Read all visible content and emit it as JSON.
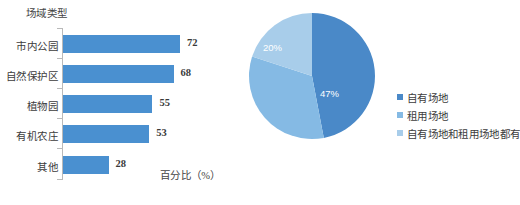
{
  "chart_data": [
    {
      "type": "bar",
      "orientation": "horizontal",
      "title": "",
      "xlabel": "百分比（%）",
      "ylabel": "场域类型",
      "categories": [
        "市内公园",
        "自然保护区",
        "植物园",
        "有机农庄",
        "其他"
      ],
      "values": [
        72,
        68,
        55,
        53,
        28
      ],
      "value_suffix": "",
      "xlim": [
        0,
        80
      ],
      "grid": false,
      "legend": "none",
      "series_color": "#4a90d0"
    },
    {
      "type": "pie",
      "title": "",
      "labels": [
        "自有场地",
        "租用场地",
        "自有场地和租用场地都有"
      ],
      "values": [
        47,
        33,
        20
      ],
      "value_labels": [
        "47%",
        "33%",
        "20%"
      ],
      "colors": [
        "#4a89c8",
        "#85bae4",
        "#a8cdea"
      ],
      "start_angle_deg": 0,
      "direction": "clockwise",
      "legend": "right"
    }
  ],
  "bar_chart": {
    "axis_title_y": "场域类型",
    "axis_title_x": "百分比（%）",
    "rows": [
      {
        "label": "市内公园",
        "value": "72"
      },
      {
        "label": "自然保护区",
        "value": "68"
      },
      {
        "label": "植物园",
        "value": "55"
      },
      {
        "label": "有机农庄",
        "value": "53"
      },
      {
        "label": "其他",
        "value": "28"
      }
    ]
  },
  "pie_chart": {
    "slices": [
      {
        "label": "自有场地",
        "pct_label": "47%",
        "color": "#4a89c8"
      },
      {
        "label": "租用场地",
        "pct_label": "33%",
        "color": "#85bae4"
      },
      {
        "label": "自有场地和租用场地都有",
        "pct_label": "20%",
        "color": "#a8cdea"
      }
    ]
  }
}
